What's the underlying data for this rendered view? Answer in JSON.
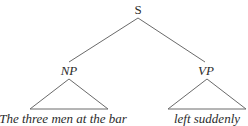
{
  "tree": {
    "root": {
      "label": "S"
    },
    "children": [
      {
        "label": "NP",
        "leaf_text": "The three men at the bar"
      },
      {
        "label": "VP",
        "leaf_text": "left suddenly"
      }
    ]
  },
  "colors": {
    "text": "#2b2b2b",
    "lines": "#6a6a6a",
    "background": "#ffffff"
  }
}
